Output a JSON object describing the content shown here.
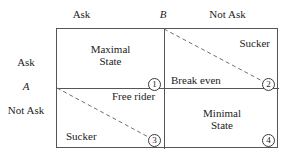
{
  "figure": {
    "type": "two-by-two-payoff-matrix",
    "players": {
      "column_player": "B",
      "row_player": "A"
    },
    "column_headers": [
      {
        "label": "Ask"
      },
      {
        "label": "Not Ask"
      }
    ],
    "row_headers": [
      {
        "label": "Ask"
      },
      {
        "label": "Not Ask"
      }
    ],
    "cells": [
      {
        "id": "cell-1",
        "row": "Ask",
        "column": "Ask",
        "title": "Maximal\nState",
        "marker": "①",
        "marker_number": "1"
      },
      {
        "id": "cell-2",
        "row": "Ask",
        "column": "Not Ask",
        "corner_label": "Sucker",
        "marker": "②",
        "marker_number": "2"
      },
      {
        "id": "cell-3",
        "row": "Not Ask",
        "column": "Ask",
        "corner_label": "Sucker",
        "marker": "③",
        "marker_number": "3"
      },
      {
        "id": "cell-4",
        "row": "Not Ask",
        "column": "Not Ask",
        "title": "Minimal\nState",
        "marker": "④",
        "marker_number": "4"
      }
    ],
    "divider_labels": [
      {
        "id": "break-even",
        "label": "Break even"
      },
      {
        "id": "free-rider",
        "label": "Free rider"
      }
    ],
    "colors": {
      "background": "#ffffff",
      "text": "#1d1d1d",
      "frame": "#555555",
      "dashed_line": "#6f6f6f"
    }
  }
}
